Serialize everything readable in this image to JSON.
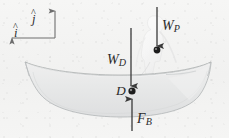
{
  "figure": {
    "background_color": "#f3f3f2",
    "ink_color": "#3a3a3a",
    "hull_fill": "#e9eaea",
    "hull_stroke": "#b9bcbd"
  },
  "axes": {
    "j": {
      "label": "j",
      "hat": "^",
      "direction": "up",
      "name": "j-hat unit vector"
    },
    "i": {
      "label": "i",
      "hat": "^",
      "direction": "left",
      "name": "i-hat unit vector"
    }
  },
  "forces": [
    {
      "key": "wp",
      "symbol": "W",
      "subscript": "P",
      "label": "W_P",
      "direction": "down",
      "description": "Weight of the person"
    },
    {
      "key": "wd",
      "symbol": "W",
      "subscript": "D",
      "label": "W_D",
      "direction": "down",
      "description": "Weight of the canoe"
    },
    {
      "key": "fb",
      "symbol": "F",
      "subscript": "B",
      "label": "F_B",
      "direction": "up",
      "description": "Buoyancy force"
    }
  ],
  "points": [
    {
      "key": "d",
      "label": "D",
      "description": "Point D, canoe centre of mass"
    },
    {
      "key": "p",
      "label": "",
      "description": "Person centre of mass"
    }
  ],
  "objects": {
    "hull": {
      "name": "canoe-hull"
    },
    "person": {
      "name": "person-silhouette"
    }
  }
}
